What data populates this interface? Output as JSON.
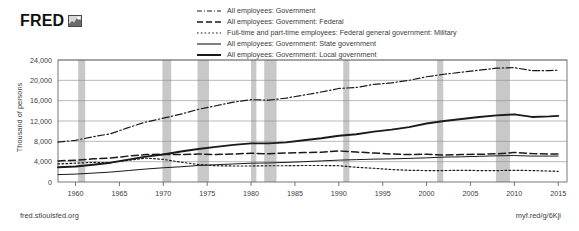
{
  "brand": {
    "wordmark": "FRED",
    "logo_icon": "chart-thumbnail-icon"
  },
  "footer": {
    "source": "fred.stlouisfed.org",
    "shortlink": "myf.red/g/6Kji"
  },
  "legend": [
    {
      "label": "All employees: Government",
      "style": "dash-dot"
    },
    {
      "label": "All employees: Government: Federal",
      "style": "dashed"
    },
    {
      "label": "Full-time and part-time employees: Federal general government: Military",
      "style": "dotted"
    },
    {
      "label": "All employees: Government: State government",
      "style": "solid-thin"
    },
    {
      "label": "All employees: Government: Local government",
      "style": "solid-thick"
    }
  ],
  "chart_data": {
    "type": "line",
    "title": "",
    "xlabel": "",
    "ylabel": "Thousand of persons",
    "xlim": [
      1958,
      2016
    ],
    "ylim": [
      0,
      24000
    ],
    "grid": true,
    "legend_position": "top-right",
    "ytick_labels": [
      "0",
      "4,000",
      "8,000",
      "12,000",
      "16,000",
      "20,000",
      "24,000"
    ],
    "yticks": [
      0,
      4000,
      8000,
      12000,
      16000,
      20000,
      24000
    ],
    "xtick_labels": [
      "1960",
      "1965",
      "1970",
      "1975",
      "1980",
      "1985",
      "1990",
      "1995",
      "2000",
      "2005",
      "2010",
      "2015"
    ],
    "xticks": [
      1960,
      1965,
      1970,
      1975,
      1980,
      1985,
      1990,
      1995,
      2000,
      2005,
      2010,
      2015
    ],
    "line_color": "#1a1a1a",
    "grid_color": "#8a8a8a",
    "recession_color": "#c8c8c8",
    "recessions": [
      [
        1960.3,
        1961.1
      ],
      [
        1969.9,
        1970.9
      ],
      [
        1973.9,
        1975.2
      ],
      [
        1980.0,
        1980.6
      ],
      [
        1981.5,
        1982.9
      ],
      [
        1990.5,
        1991.2
      ],
      [
        2001.2,
        2001.9
      ],
      [
        2007.9,
        2009.5
      ]
    ],
    "x": [
      1958,
      1960,
      1962,
      1964,
      1966,
      1968,
      1970,
      1972,
      1974,
      1976,
      1978,
      1980,
      1982,
      1984,
      1986,
      1988,
      1990,
      1992,
      1994,
      1996,
      1998,
      2000,
      2002,
      2004,
      2006,
      2008,
      2010,
      2012,
      2014,
      2015
    ],
    "series": [
      {
        "name": "All employees: Government",
        "style": "dash-dot",
        "values": [
          7840,
          8200,
          8900,
          9500,
          10700,
          11800,
          12550,
          13350,
          14300,
          15000,
          15700,
          16200,
          16100,
          16500,
          17100,
          17700,
          18400,
          18600,
          19200,
          19500,
          20000,
          20700,
          21200,
          21600,
          22000,
          22400,
          22500,
          21900,
          21900,
          22000
        ]
      },
      {
        "name": "All employees: Government: Federal",
        "style": "dashed",
        "values": [
          4150,
          4300,
          4550,
          4700,
          5100,
          5400,
          5450,
          5400,
          5500,
          5400,
          5500,
          5650,
          5550,
          5700,
          5800,
          5850,
          6100,
          5900,
          5700,
          5500,
          5400,
          5450,
          5300,
          5400,
          5450,
          5550,
          5800,
          5600,
          5500,
          5500
        ]
      },
      {
        "name": "Full-time and part-time employees: Federal general government: Military",
        "style": "dotted",
        "values": [
          3550,
          3700,
          3850,
          3800,
          4250,
          4700,
          4450,
          3900,
          3450,
          3200,
          3150,
          3150,
          3200,
          3200,
          3250,
          3250,
          3200,
          2900,
          2700,
          2450,
          2300,
          2250,
          2250,
          2300,
          2250,
          2250,
          2300,
          2250,
          2150,
          2100
        ]
      },
      {
        "name": "All employees: Government: State government",
        "style": "solid-thin",
        "values": [
          1450,
          1550,
          1750,
          1950,
          2250,
          2550,
          2800,
          3000,
          3250,
          3400,
          3550,
          3700,
          3750,
          3850,
          4000,
          4150,
          4300,
          4400,
          4500,
          4550,
          4650,
          4750,
          4900,
          4950,
          5050,
          5150,
          5200,
          5100,
          5100,
          5100
        ]
      },
      {
        "name": "All employees: Government: Local government",
        "style": "solid-thick",
        "values": [
          2900,
          3050,
          3400,
          3800,
          4400,
          5000,
          5400,
          6000,
          6500,
          6900,
          7300,
          7600,
          7600,
          7800,
          8200,
          8600,
          9100,
          9400,
          9900,
          10300,
          10800,
          11500,
          12000,
          12400,
          12800,
          13100,
          13300,
          12800,
          12900,
          13000
        ]
      }
    ]
  }
}
